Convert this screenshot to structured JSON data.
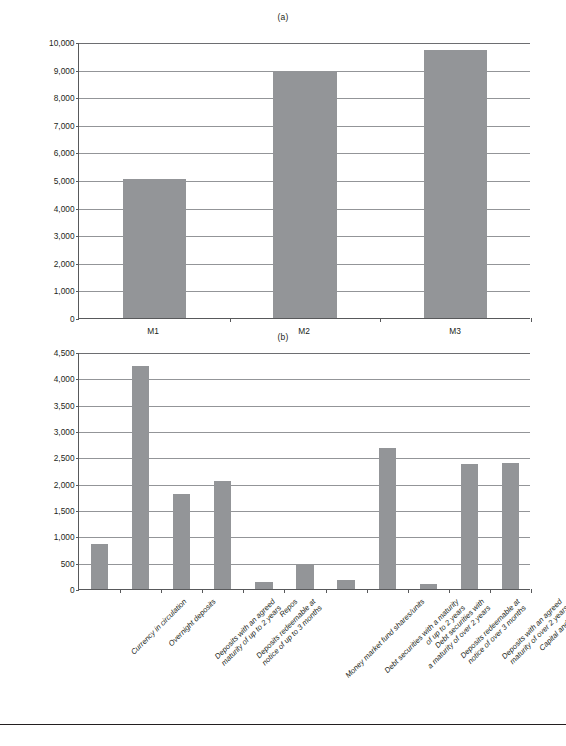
{
  "figure": {
    "panel_a_label": "(a)",
    "panel_b_label": "(b)"
  },
  "chart_data": [
    {
      "type": "bar",
      "title": "(a)",
      "xlabel": "",
      "ylabel": "",
      "ylim": [
        0,
        10000
      ],
      "ytick_step": 1000,
      "grid": true,
      "legend": "none",
      "bar_color": "#939598",
      "categories": [
        "M1",
        "M2",
        "M3"
      ],
      "values": [
        5050,
        8920,
        9710
      ],
      "ytick_labels": [
        "0",
        "1,000",
        "2,000",
        "3,000",
        "4,000",
        "5,000",
        "6,000",
        "7,000",
        "8,000",
        "9,000",
        "10,000"
      ]
    },
    {
      "type": "bar",
      "title": "(b)",
      "xlabel": "",
      "ylabel": "",
      "ylim": [
        0,
        4500
      ],
      "ytick_step": 500,
      "grid": true,
      "legend": "none",
      "bar_color": "#939598",
      "categories": [
        "Currency in circulation",
        "Overnight deposits",
        "Deposits with an agreed\nmaturity of up to 2 years",
        "Deposits redeemable at\nnotice of up to 3 months",
        "Repos",
        "Money market fund shares/units",
        "Debt securities with a maturity\nof up to 2 years",
        "Debt securities with\na maturity of over 2 years",
        "Deposits redeemable at\nnotice of over 3 months",
        "Deposits with an agreed\nmaturity of over 2 years",
        "Capital and reserves"
      ],
      "values": [
        855,
        4225,
        1800,
        2060,
        130,
        460,
        175,
        2680,
        95,
        2380,
        2385
      ],
      "ytick_labels": [
        "0",
        "500",
        "1,000",
        "1,500",
        "2,000",
        "2,500",
        "3,000",
        "3,500",
        "4,000",
        "4,500"
      ]
    }
  ],
  "ghost_text": {
    "top": "",
    "body": ""
  }
}
